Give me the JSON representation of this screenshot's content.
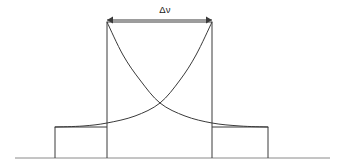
{
  "figure": {
    "kind": "technical-line-diagram",
    "title_text": "",
    "width": 342,
    "height": 168,
    "background_color": "#ffffff",
    "line_color": "#3a3a3a",
    "baseline_color": "#8a8a8a",
    "label_color": "#222222"
  },
  "annotation": {
    "dimension_label": "Δν",
    "dimension_label_x": 165,
    "dimension_label_y": 14,
    "arrow_y": 20,
    "arrow_left_x": 107,
    "arrow_right_x": 212,
    "arrow_head_size": 5,
    "arrow_name": "bandwidth-dimension"
  },
  "geometry": {
    "baseline_y": 158,
    "baseline_x_start": 15,
    "baseline_x_end": 330,
    "peak_top_y": 22,
    "shoulder_y": 127,
    "left_shoulder_x": 55,
    "left_peak_x": 107,
    "right_peak_x": 212,
    "right_shoulder_x": 268,
    "crossing_x": 160,
    "crossing_y": 103
  },
  "chart_data": {
    "type": "line",
    "title": "",
    "xlabel": "",
    "ylabel": "",
    "grid": false,
    "legend": "none",
    "annotations": [
      {
        "text": "Δν",
        "type": "dimension-arrow",
        "from_x": 107,
        "to_x": 212,
        "at_y": 20
      }
    ],
    "series": [
      {
        "name": "step-profile",
        "type": "step",
        "points": [
          [
            15,
            158
          ],
          [
            55,
            158
          ],
          [
            55,
            127
          ],
          [
            107,
            127
          ],
          [
            107,
            22
          ],
          [
            212,
            22
          ],
          [
            212,
            127
          ],
          [
            268,
            127
          ],
          [
            268,
            158
          ],
          [
            330,
            158
          ]
        ]
      },
      {
        "name": "decay-curve-falling",
        "type": "curve",
        "points": [
          [
            107,
            22
          ],
          [
            123,
            55
          ],
          [
            140,
            80
          ],
          [
            160,
            103
          ],
          [
            185,
            116
          ],
          [
            212,
            123
          ],
          [
            240,
            126
          ],
          [
            268,
            127
          ]
        ]
      },
      {
        "name": "decay-curve-rising",
        "type": "curve",
        "points": [
          [
            55,
            127
          ],
          [
            83,
            126
          ],
          [
            107,
            123
          ],
          [
            135,
            116
          ],
          [
            160,
            103
          ],
          [
            180,
            80
          ],
          [
            196,
            55
          ],
          [
            212,
            22
          ]
        ]
      }
    ]
  },
  "elements": {
    "baseline_name": "baseline-axis",
    "left_vertical_name": "left-band-edge",
    "right_vertical_name": "right-band-edge",
    "left_shoulder_name": "left-shoulder-step",
    "right_shoulder_name": "right-shoulder-step",
    "falling_curve_name": "falling-decay-curve",
    "rising_curve_name": "rising-decay-curve"
  }
}
